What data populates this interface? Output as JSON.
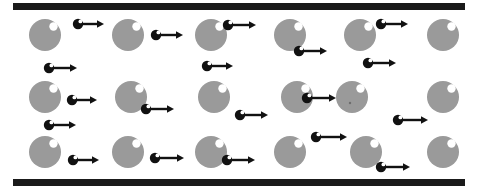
{
  "figure": {
    "canvas": {
      "width": 477,
      "height": 191,
      "background": "#ffffff"
    },
    "colors": {
      "plate": "#1a1a1a",
      "large_particle": "#9a9a9a",
      "large_particle_highlight": "#ffffff",
      "small_particle": "#111111",
      "small_particle_highlight": "#ffffff",
      "arrow": "#111111",
      "background": "#ffffff"
    }
  },
  "plates": [
    {
      "name": "top-plate",
      "x": 13,
      "y": 3,
      "width": 452,
      "height": 7
    },
    {
      "name": "bottom-plate",
      "x": 13,
      "y": 179,
      "width": 452,
      "height": 7
    }
  ],
  "large_particles": {
    "radius": 16,
    "highlight_radius": 4.2,
    "highlight_offset_x": 8.5,
    "highlight_offset_y": -8.5,
    "items": [
      {
        "row": 1,
        "cx": 45,
        "cy": 35
      },
      {
        "row": 1,
        "cx": 128,
        "cy": 35
      },
      {
        "row": 1,
        "cx": 211,
        "cy": 35
      },
      {
        "row": 1,
        "cx": 290,
        "cy": 35
      },
      {
        "row": 1,
        "cx": 360,
        "cy": 35
      },
      {
        "row": 1,
        "cx": 443,
        "cy": 35
      },
      {
        "row": 2,
        "cx": 45,
        "cy": 97
      },
      {
        "row": 2,
        "cx": 131,
        "cy": 97
      },
      {
        "row": 2,
        "cx": 214,
        "cy": 97
      },
      {
        "row": 2,
        "cx": 297,
        "cy": 97
      },
      {
        "row": 2,
        "cx": 352,
        "cy": 97
      },
      {
        "row": 2,
        "cx": 443,
        "cy": 97
      },
      {
        "row": 3,
        "cx": 45,
        "cy": 152
      },
      {
        "row": 3,
        "cx": 128,
        "cy": 152
      },
      {
        "row": 3,
        "cx": 211,
        "cy": 152
      },
      {
        "row": 3,
        "cx": 290,
        "cy": 152
      },
      {
        "row": 3,
        "cx": 366,
        "cy": 152
      },
      {
        "row": 3,
        "cx": 443,
        "cy": 152
      }
    ],
    "specks": [
      {
        "cx": 350,
        "cy": 103,
        "r": 1.2
      }
    ]
  },
  "small_particles": {
    "radius": 5.2,
    "highlight_radius": 1.9,
    "highlight_offset_x": 2.4,
    "highlight_offset_y": -2.6,
    "arrow_thickness": 2.4,
    "arrow_head_length": 7,
    "arrow_head_width": 7.5,
    "items": [
      {
        "name": "particle-r1-a",
        "cx": 78,
        "cy": 24,
        "length": 26
      },
      {
        "name": "particle-r1-b",
        "cx": 156,
        "cy": 35,
        "length": 27
      },
      {
        "name": "particle-r1-c",
        "cx": 228,
        "cy": 25,
        "length": 28
      },
      {
        "name": "particle-r1-d",
        "cx": 299,
        "cy": 51,
        "length": 28
      },
      {
        "name": "particle-r1-e",
        "cx": 381,
        "cy": 24,
        "length": 27
      },
      {
        "name": "particle-r2-a",
        "cx": 49,
        "cy": 68,
        "length": 28
      },
      {
        "name": "particle-r2-b",
        "cx": 207,
        "cy": 66,
        "length": 26
      },
      {
        "name": "particle-r2-c",
        "cx": 368,
        "cy": 63,
        "length": 28
      },
      {
        "name": "particle-r2-d",
        "cx": 72,
        "cy": 100,
        "length": 25
      },
      {
        "name": "particle-r2-e",
        "cx": 146,
        "cy": 109,
        "length": 28
      },
      {
        "name": "particle-r2-f",
        "cx": 240,
        "cy": 115,
        "length": 28
      },
      {
        "name": "particle-r2-g",
        "cx": 307,
        "cy": 98,
        "length": 29
      },
      {
        "name": "particle-r3-a",
        "cx": 49,
        "cy": 125,
        "length": 27
      },
      {
        "name": "particle-r3-b",
        "cx": 398,
        "cy": 120,
        "length": 30
      },
      {
        "name": "particle-r3-c",
        "cx": 316,
        "cy": 137,
        "length": 31
      },
      {
        "name": "particle-r3-d",
        "cx": 73,
        "cy": 160,
        "length": 26
      },
      {
        "name": "particle-r3-e",
        "cx": 155,
        "cy": 158,
        "length": 29
      },
      {
        "name": "particle-r3-f",
        "cx": 227,
        "cy": 160,
        "length": 28
      },
      {
        "name": "particle-r3-g",
        "cx": 381,
        "cy": 167,
        "length": 29
      }
    ]
  }
}
